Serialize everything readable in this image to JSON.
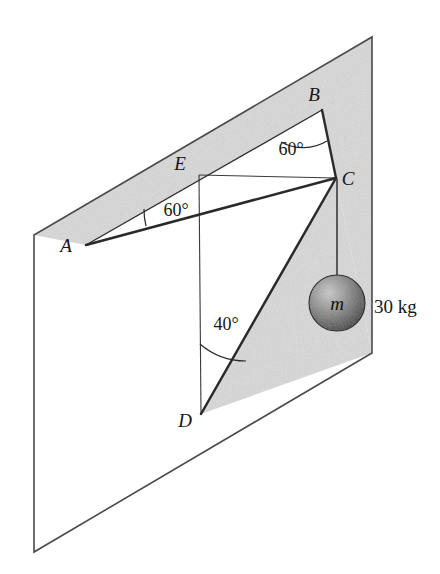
{
  "figure": {
    "background_color": "#ffffff",
    "plane": {
      "name": "wall-plane",
      "outline_color": "#4a4a4a",
      "unshaded_fill": "#ffffff",
      "shaded_fill": "#d9d9d9",
      "shaded_note": "stippled gray region bounded by A-B, B-C, C-D and plane edges"
    },
    "points": {
      "A": {
        "label": "A",
        "x": 86,
        "y": 245,
        "label_x": 66,
        "label_y": 252
      },
      "B": {
        "label": "B",
        "x": 322,
        "y": 110,
        "label_x": 314,
        "label_y": 101
      },
      "C": {
        "label": "C",
        "x": 336,
        "y": 178,
        "label_x": 346,
        "label_y": 184
      },
      "D": {
        "label": "D",
        "x": 201,
        "y": 414,
        "label_x": 183,
        "label_y": 426
      },
      "E": {
        "label": "E",
        "x": 199,
        "y": 175,
        "label_x": 178,
        "label_y": 170
      }
    },
    "segments": [
      {
        "name": "cable-AB",
        "from": "A",
        "to": "B",
        "weight": "thin"
      },
      {
        "name": "cable-AC",
        "from": "A",
        "to": "C",
        "weight": "thick"
      },
      {
        "name": "cable-BC",
        "from": "B",
        "to": "C",
        "weight": "thick"
      },
      {
        "name": "cable-DC",
        "from": "D",
        "to": "C",
        "weight": "thick"
      },
      {
        "name": "reference-EC",
        "from": "E",
        "to": "C",
        "weight": "thin"
      },
      {
        "name": "reference-ED",
        "from": "E",
        "to": "D",
        "weight": "thin"
      },
      {
        "name": "cord-C-to-mass",
        "from": "C",
        "to": "mass",
        "weight": "thin"
      }
    ],
    "angles": [
      {
        "name": "angle-at-B",
        "value": "60°",
        "vertex": "B",
        "label_x": 291,
        "label_y": 148
      },
      {
        "name": "angle-at-A",
        "value": "60°",
        "vertex": "A",
        "label_x": 156,
        "label_y": 210
      },
      {
        "name": "angle-at-D",
        "value": "40°",
        "vertex": "D",
        "label_x": 206,
        "label_y": 330
      }
    ],
    "mass": {
      "name": "hanging-sphere",
      "symbol": "m",
      "weight_label": "30 kg",
      "center_x": 337,
      "center_y": 303,
      "radius": 28,
      "fill_light": "#b9b9b9",
      "fill_dark": "#3a3a3a",
      "label_x": 374,
      "label_y": 313
    }
  }
}
